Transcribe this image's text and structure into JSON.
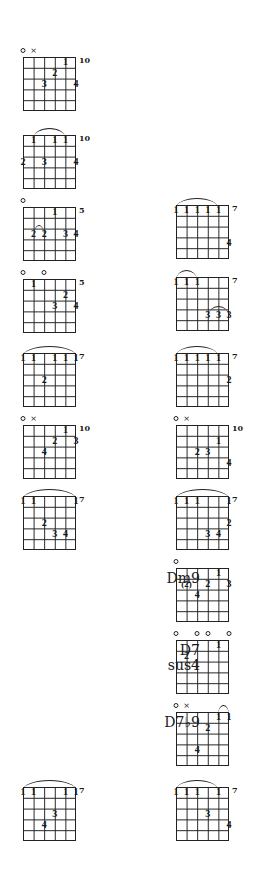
{
  "page": {
    "columns": [
      "left",
      "right"
    ]
  },
  "chords": [
    {
      "id": "L1",
      "col": "left",
      "x": 23,
      "y": 57,
      "fret": "10",
      "open": [
        0
      ],
      "mute": [
        1
      ],
      "barre": null,
      "fingers": [
        {
          "s": 4,
          "f": 0,
          "n": "1"
        },
        {
          "s": 3,
          "f": 1,
          "n": "2"
        },
        {
          "s": 2,
          "f": 2,
          "n": "3"
        },
        {
          "s": 5,
          "f": 2,
          "n": "4"
        }
      ]
    },
    {
      "id": "L2",
      "col": "left",
      "x": 23,
      "y": 135,
      "fret": "10",
      "open": [],
      "mute": [],
      "barre": {
        "from": 1,
        "to": 4
      },
      "fingers": [
        {
          "s": 1,
          "f": 0,
          "n": "1"
        },
        {
          "s": 3,
          "f": 0,
          "n": "1"
        },
        {
          "s": 4,
          "f": 0,
          "n": "1"
        },
        {
          "s": 0,
          "f": 2,
          "n": "2"
        },
        {
          "s": 2,
          "f": 2,
          "n": "3"
        },
        {
          "s": 5,
          "f": 2,
          "n": "4"
        }
      ]
    },
    {
      "id": "L3",
      "col": "left",
      "x": 23,
      "y": 207,
      "fret": "5",
      "open": [
        0
      ],
      "mute": [],
      "barre": {
        "from": 1,
        "to": 2,
        "fret": 2
      },
      "fingers": [
        {
          "s": 3,
          "f": 0,
          "n": "1"
        },
        {
          "s": 1,
          "f": 2,
          "n": "2"
        },
        {
          "s": 2,
          "f": 2,
          "n": "2"
        },
        {
          "s": 4,
          "f": 2,
          "n": "3"
        },
        {
          "s": 5,
          "f": 2,
          "n": "4"
        }
      ]
    },
    {
      "id": "L4",
      "col": "left",
      "x": 23,
      "y": 279,
      "fret": "5",
      "open": [
        0,
        2
      ],
      "mute": [],
      "barre": null,
      "fingers": [
        {
          "s": 1,
          "f": 0,
          "n": "1"
        },
        {
          "s": 4,
          "f": 1,
          "n": "2"
        },
        {
          "s": 3,
          "f": 2,
          "n": "3"
        },
        {
          "s": 5,
          "f": 2,
          "n": "4"
        }
      ]
    },
    {
      "id": "L5",
      "col": "left",
      "x": 23,
      "y": 353,
      "fret": "7",
      "open": [],
      "mute": [],
      "barre": {
        "from": 0,
        "to": 5
      },
      "fingers": [
        {
          "s": 0,
          "f": 0,
          "n": "1"
        },
        {
          "s": 1,
          "f": 0,
          "n": "1"
        },
        {
          "s": 3,
          "f": 0,
          "n": "1"
        },
        {
          "s": 4,
          "f": 0,
          "n": "1"
        },
        {
          "s": 5,
          "f": 0,
          "n": "1"
        },
        {
          "s": 2,
          "f": 2,
          "n": "2"
        }
      ]
    },
    {
      "id": "L6",
      "col": "left",
      "x": 23,
      "y": 425,
      "fret": "10",
      "open": [
        0
      ],
      "mute": [
        1
      ],
      "barre": null,
      "fingers": [
        {
          "s": 4,
          "f": 0,
          "n": "1"
        },
        {
          "s": 3,
          "f": 1,
          "n": "2"
        },
        {
          "s": 5,
          "f": 1,
          "n": "3"
        },
        {
          "s": 2,
          "f": 2,
          "n": "4"
        }
      ]
    },
    {
      "id": "L7",
      "col": "left",
      "x": 23,
      "y": 496,
      "fret": "7",
      "open": [],
      "mute": [],
      "barre": {
        "from": 0,
        "to": 5
      },
      "fingers": [
        {
          "s": 0,
          "f": 0,
          "n": "1"
        },
        {
          "s": 1,
          "f": 0,
          "n": "1"
        },
        {
          "s": 5,
          "f": 0,
          "n": "1"
        },
        {
          "s": 2,
          "f": 2,
          "n": "2"
        },
        {
          "s": 3,
          "f": 3,
          "n": "3"
        },
        {
          "s": 4,
          "f": 3,
          "n": "4"
        }
      ]
    },
    {
      "id": "L8",
      "col": "left",
      "x": 23,
      "y": 787,
      "fret": "7",
      "open": [],
      "mute": [],
      "barre": {
        "from": 0,
        "to": 5
      },
      "fingers": [
        {
          "s": 0,
          "f": 0,
          "n": "1"
        },
        {
          "s": 1,
          "f": 0,
          "n": "1"
        },
        {
          "s": 4,
          "f": 0,
          "n": "1"
        },
        {
          "s": 5,
          "f": 0,
          "n": "1"
        },
        {
          "s": 3,
          "f": 2,
          "n": "3"
        },
        {
          "s": 2,
          "f": 3,
          "n": "4"
        }
      ]
    },
    {
      "id": "R1",
      "col": "right",
      "x": 176,
      "y": 205,
      "fret": "7",
      "open": [],
      "mute": [],
      "barre": {
        "from": 0,
        "to": 4
      },
      "fingers": [
        {
          "s": 0,
          "f": 0,
          "n": "1"
        },
        {
          "s": 1,
          "f": 0,
          "n": "1"
        },
        {
          "s": 2,
          "f": 0,
          "n": "1"
        },
        {
          "s": 3,
          "f": 0,
          "n": "1"
        },
        {
          "s": 4,
          "f": 0,
          "n": "1"
        },
        {
          "s": 5,
          "f": 3,
          "n": "4"
        }
      ]
    },
    {
      "id": "R2",
      "col": "right",
      "x": 176,
      "y": 277,
      "fret": "7",
      "open": [],
      "mute": [],
      "barre": {
        "from": 0,
        "to": 2
      },
      "barre2": {
        "from": 3,
        "to": 5,
        "fret": 3
      },
      "fingers": [
        {
          "s": 0,
          "f": 0,
          "n": "1"
        },
        {
          "s": 1,
          "f": 0,
          "n": "1"
        },
        {
          "s": 2,
          "f": 0,
          "n": "1"
        },
        {
          "s": 3,
          "f": 3,
          "n": "3"
        },
        {
          "s": 4,
          "f": 3,
          "n": "3"
        },
        {
          "s": 5,
          "f": 3,
          "n": "3"
        }
      ]
    },
    {
      "id": "R3",
      "col": "right",
      "x": 176,
      "y": 353,
      "fret": "7",
      "open": [],
      "mute": [],
      "barre": {
        "from": 0,
        "to": 4
      },
      "fingers": [
        {
          "s": 0,
          "f": 0,
          "n": "1"
        },
        {
          "s": 1,
          "f": 0,
          "n": "1"
        },
        {
          "s": 2,
          "f": 0,
          "n": "1"
        },
        {
          "s": 3,
          "f": 0,
          "n": "1"
        },
        {
          "s": 4,
          "f": 0,
          "n": "1"
        },
        {
          "s": 5,
          "f": 2,
          "n": "2"
        }
      ]
    },
    {
      "id": "R4",
      "col": "right",
      "x": 176,
      "y": 425,
      "fret": "10",
      "open": [
        0
      ],
      "mute": [
        1
      ],
      "barre": null,
      "fingers": [
        {
          "s": 4,
          "f": 1,
          "n": "1"
        },
        {
          "s": 2,
          "f": 2,
          "n": "2"
        },
        {
          "s": 3,
          "f": 2,
          "n": "3"
        },
        {
          "s": 5,
          "f": 3,
          "n": "4"
        }
      ]
    },
    {
      "id": "R5",
      "col": "right",
      "x": 176,
      "y": 496,
      "fret": "7",
      "open": [],
      "mute": [],
      "barre": {
        "from": 0,
        "to": 5
      },
      "fingers": [
        {
          "s": 0,
          "f": 0,
          "n": "1"
        },
        {
          "s": 1,
          "f": 0,
          "n": "1"
        },
        {
          "s": 2,
          "f": 0,
          "n": "1"
        },
        {
          "s": 5,
          "f": 0,
          "n": "1"
        },
        {
          "s": 5,
          "f": 2,
          "n": "2"
        },
        {
          "s": 3,
          "f": 3,
          "n": "3"
        },
        {
          "s": 4,
          "f": 3,
          "n": "4"
        }
      ]
    },
    {
      "id": "R6",
      "col": "right",
      "x": 176,
      "y": 568,
      "name": "Dm9",
      "fret": "",
      "open": [
        0
      ],
      "mute": [],
      "barre": null,
      "fingers": [
        {
          "s": 4,
          "f": 0,
          "n": "1"
        },
        {
          "s": 1,
          "f": 1,
          "n": "(2)"
        },
        {
          "s": 3,
          "f": 1,
          "n": "2"
        },
        {
          "s": 5,
          "f": 1,
          "n": "3"
        },
        {
          "s": 2,
          "f": 2,
          "n": "4"
        }
      ]
    },
    {
      "id": "R7",
      "col": "right",
      "x": 176,
      "y": 640,
      "name": "D7\nsus4",
      "fret": "",
      "open": [
        0,
        2,
        3,
        5
      ],
      "mute": [],
      "barre": null,
      "fingers": [
        {
          "s": 4,
          "f": 0,
          "n": "1"
        },
        {
          "s": 1,
          "f": 1,
          "n": "2"
        }
      ]
    },
    {
      "id": "R8",
      "col": "right",
      "x": 176,
      "y": 712,
      "name": "D7♭9",
      "fret": "",
      "open": [
        0
      ],
      "mute": [
        1
      ],
      "barre": {
        "from": 4,
        "to": 5
      },
      "fingers": [
        {
          "s": 4,
          "f": 0,
          "n": "1"
        },
        {
          "s": 5,
          "f": 0,
          "n": "1"
        },
        {
          "s": 3,
          "f": 1,
          "n": "2"
        },
        {
          "s": 2,
          "f": 3,
          "n": "4"
        }
      ]
    },
    {
      "id": "R9",
      "col": "right",
      "x": 176,
      "y": 787,
      "fret": "7",
      "open": [],
      "mute": [],
      "barre": {
        "from": 0,
        "to": 4
      },
      "fingers": [
        {
          "s": 0,
          "f": 0,
          "n": "1"
        },
        {
          "s": 1,
          "f": 0,
          "n": "1"
        },
        {
          "s": 2,
          "f": 0,
          "n": "1"
        },
        {
          "s": 4,
          "f": 0,
          "n": "1"
        },
        {
          "s": 3,
          "f": 2,
          "n": "3"
        },
        {
          "s": 5,
          "f": 3,
          "n": "4"
        }
      ]
    }
  ],
  "symbols": {
    "open": "○",
    "mute": "×"
  }
}
